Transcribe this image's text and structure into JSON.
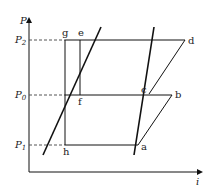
{
  "diagram": {
    "axes": {
      "y_label": "P",
      "x_label": "i"
    },
    "pressure_levels": [
      {
        "name": "P2",
        "base": "P",
        "sub": "2"
      },
      {
        "name": "P0",
        "base": "P",
        "sub": "0"
      },
      {
        "name": "P1",
        "base": "P",
        "sub": "1"
      }
    ],
    "points": {
      "a": "a",
      "b": "b",
      "c": "c",
      "d": "d",
      "e": "e",
      "f": "f",
      "g": "g",
      "h": "h"
    },
    "colors": {
      "line": "#111111",
      "dash": "#555555"
    }
  }
}
